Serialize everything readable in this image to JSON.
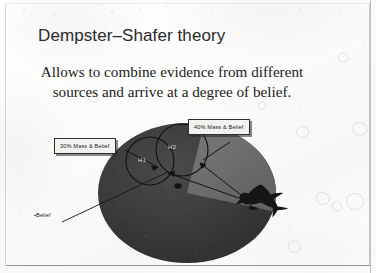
{
  "slide": {
    "title": "Dempster–Shafer theory",
    "body_line_1": "Allows to combine evidence from different",
    "body_line_2": "sources and arrive at a degree of belief.",
    "colors": {
      "paper": "#fdfdfd",
      "ink": "#1d1d1d",
      "title_ink": "#2a2a2a",
      "frame": "#5a5a5a",
      "ellipse_dark": "#3a3a3a",
      "ellipse_wedge": "#6d6d6d",
      "callout_fill": "#f2f2f0",
      "callout_border": "#2e2e2e",
      "circle_stroke": "#0d0d0d"
    }
  },
  "diagram": {
    "name": "dempster-shafer-belief-diagram",
    "callouts": [
      {
        "id": "mass-30",
        "label": "30% Mass & Belief"
      },
      {
        "id": "mass-40",
        "label": "40% Mass & Belief"
      }
    ],
    "hypotheses": [
      {
        "id": "h1",
        "label": "H1"
      },
      {
        "id": "h2",
        "label": "H2"
      }
    ],
    "belief_marker": {
      "label": "•Belief"
    },
    "aircraft_icon": "airplane-silhouette-icon"
  }
}
